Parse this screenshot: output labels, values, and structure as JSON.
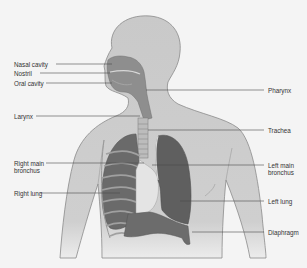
{
  "diagram": {
    "colors": {
      "background": "#f4f4f4",
      "body_fill": "#c9c9c9",
      "body_outline": "#8a8a8a",
      "lung_dark": "#5f5f5f",
      "lung_mid": "#767676",
      "airway_light": "#e2e2e2",
      "leader_line": "#4a4a4a",
      "label_text": "#333333"
    },
    "labels_left": [
      {
        "id": "nasal-cavity",
        "text": "Nasal cavity"
      },
      {
        "id": "nostril",
        "text": "Nostril"
      },
      {
        "id": "oral-cavity",
        "text": "Oral cavity"
      },
      {
        "id": "larynx",
        "text": "Larynx"
      },
      {
        "id": "right-main-bronchus",
        "line1": "Right main",
        "line2": "bronchus"
      },
      {
        "id": "right-lung",
        "text": "Right lung"
      }
    ],
    "labels_right": [
      {
        "id": "pharynx",
        "text": "Pharynx"
      },
      {
        "id": "trachea",
        "text": "Trachea"
      },
      {
        "id": "left-main-bronchus",
        "line1": "Left main",
        "line2": "bronchus"
      },
      {
        "id": "left-lung",
        "text": "Left lung"
      },
      {
        "id": "diaphragm",
        "text": "Diaphragm"
      }
    ]
  }
}
